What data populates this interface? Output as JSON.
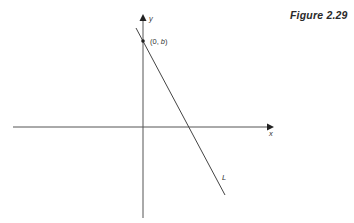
{
  "figure": {
    "caption": "Figure 2.29",
    "axes": {
      "x_label": "x",
      "y_label": "y"
    },
    "line": {
      "label": "L",
      "slope_sign": "negative"
    },
    "point": {
      "label_open": "(0, ",
      "label_var": "b",
      "label_close": ")",
      "full_label": "(0, b)"
    },
    "colors": {
      "ink": "#3a3a3a",
      "background": "#ffffff"
    }
  }
}
